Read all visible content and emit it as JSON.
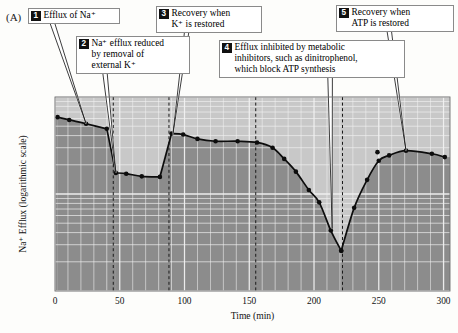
{
  "panel": {
    "label": "(A)"
  },
  "callouts": [
    {
      "num": "1",
      "text": "Efflux of Na⁺"
    },
    {
      "num": "2",
      "text": "Na⁺ efflux reduced\nby removal of\nexternal K⁺"
    },
    {
      "num": "3",
      "text": "Recovery when\nK⁺ is restored"
    },
    {
      "num": "4",
      "text": "Efflux inhibited by metabolic\ninhibitors, such as dinitrophenol,\nwhich block ATP synthesis"
    },
    {
      "num": "5",
      "text": "Recovery when\nATP is restored"
    }
  ],
  "colors": {
    "fill_below": "#8c8c8c",
    "fill_above": "#c8c8c8",
    "grid": "#f2f2f2",
    "curve": "#0d0d0d",
    "box_border": "#8a8a8a",
    "num_badge": "#111111"
  },
  "chart_data": {
    "type": "line",
    "title": "",
    "xlabel": "Time (min)",
    "ylabel": "Na⁺ Efflux (logarithmic scale)",
    "xlim": [
      0,
      305
    ],
    "ylim": [
      1,
      100
    ],
    "yscale": "log",
    "grid": true,
    "legend": null,
    "xticks": [
      0,
      50,
      100,
      150,
      200,
      250,
      300
    ],
    "xticklabels": [
      "0",
      "50",
      "100",
      "150",
      "200",
      "250",
      "300"
    ],
    "yticks": [],
    "yticklabels": [],
    "phase_dividers": [
      45,
      88,
      155,
      222
    ],
    "segments": [
      {
        "name": "efflux-of-na",
        "points": [
          [
            2,
            62
          ],
          [
            11,
            58
          ],
          [
            24,
            53
          ],
          [
            40,
            47
          ]
        ]
      },
      {
        "name": "k-removed-reduced-efflux",
        "points": [
          [
            47,
            16.5
          ],
          [
            55,
            16.2
          ],
          [
            67,
            15.2
          ],
          [
            81,
            15.0
          ]
        ]
      },
      {
        "name": "k-restored-recovery-then-dnp-inhibition",
        "points": [
          [
            90,
            42
          ],
          [
            99,
            41
          ],
          [
            110,
            37
          ],
          [
            124,
            35
          ],
          [
            141,
            35
          ],
          [
            156,
            34
          ],
          [
            168,
            30
          ],
          [
            177,
            23
          ],
          [
            186,
            17
          ],
          [
            196,
            11
          ],
          [
            204,
            8.2
          ],
          [
            213,
            4.2
          ],
          [
            221,
            2.6
          ]
        ]
      },
      {
        "name": "atp-restored-recovery",
        "points": [
          [
            221,
            2.6
          ],
          [
            231,
            7.2
          ],
          [
            241,
            14
          ],
          [
            250,
            22
          ],
          [
            258,
            25
          ],
          [
            271,
            28
          ],
          [
            291,
            26
          ],
          [
            301,
            24
          ]
        ]
      }
    ],
    "outlier_points": [
      [
        249,
        27
      ]
    ],
    "annotations": [
      {
        "num": "1",
        "target_x": 24,
        "target_y": 53
      },
      {
        "num": "2",
        "target_x": 47,
        "target_y": 16.5
      },
      {
        "num": "3",
        "target_x": 91,
        "target_y": 41
      },
      {
        "num": "4",
        "target_x": 214,
        "target_y": 4.4
      },
      {
        "num": "5",
        "target_x": 271,
        "target_y": 28
      }
    ]
  }
}
